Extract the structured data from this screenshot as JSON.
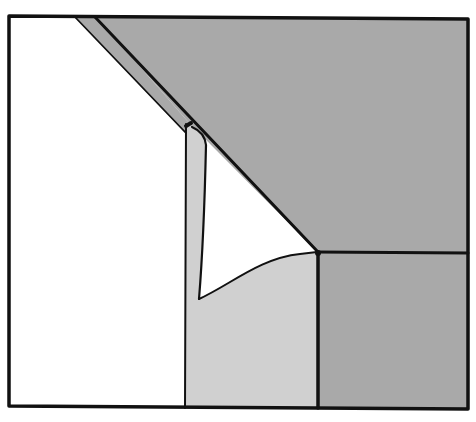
{
  "diagram": {
    "colors": {
      "background": "#ffffff",
      "outline": "#111111",
      "dark_grey": "#a9a9a9",
      "light_grey": "#cfcfcf",
      "white": "#ffffff"
    },
    "regions": [
      {
        "id": "left-white-panel",
        "fill": "white"
      },
      {
        "id": "diagonal-strip",
        "fill": "dark_grey"
      },
      {
        "id": "upper-right-dark-panel",
        "fill": "dark_grey"
      },
      {
        "id": "lower-right-dark-panel",
        "fill": "dark_grey"
      },
      {
        "id": "center-light-panel",
        "fill": "light_grey"
      },
      {
        "id": "white-triangle-gap",
        "fill": "white"
      }
    ]
  }
}
